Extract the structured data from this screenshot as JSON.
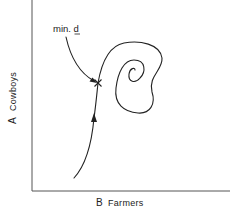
{
  "figure": {
    "type": "phase-trajectory-diagram",
    "x_axis": {
      "letter": "B",
      "name": "Farmers"
    },
    "y_axis": {
      "letter": "A",
      "name": "Cowboys"
    },
    "annotation": {
      "text_prefix": "min. ",
      "text_underlined": "d",
      "points_to": "minimum-distance-point"
    },
    "trajectory": {
      "description": "Curve rises from lower left with a direction arrow, passes the marked minimum-distance point (x), then loops clockwise and spirals inward",
      "direction": "upward-then-spiral-inward"
    },
    "marker": {
      "symbol": "×",
      "meaning": "point of minimum d"
    },
    "colors": {
      "ink": "#222222",
      "axis": "#555555",
      "background": "#ffffff"
    }
  }
}
